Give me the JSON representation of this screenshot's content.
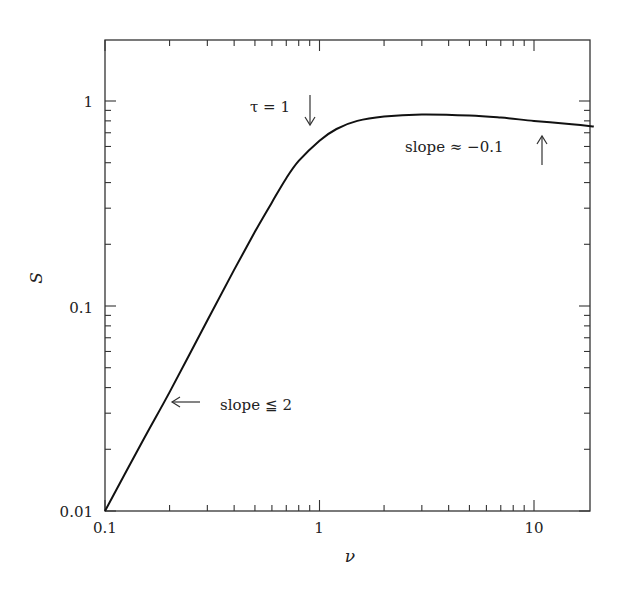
{
  "chart_data": {
    "type": "line",
    "title": "",
    "xlabel": "ν",
    "ylabel": "S",
    "xscale": "log",
    "yscale": "log",
    "xlim": [
      0.1,
      19
    ],
    "ylim": [
      0.01,
      2
    ],
    "grid": false,
    "legend": null,
    "x_tick_labels": [
      "0.1",
      "1",
      "10"
    ],
    "y_tick_labels": [
      "0.01",
      "0.1",
      "1"
    ],
    "series": [
      {
        "name": "S(ν)",
        "x": [
          0.1,
          0.15,
          0.2,
          0.3,
          0.4,
          0.5,
          0.6,
          0.7,
          0.8,
          1.0,
          1.2,
          1.5,
          2.0,
          3.0,
          5.0,
          7.0,
          10.0,
          15.0,
          19.0
        ],
        "y": [
          0.01,
          0.022,
          0.038,
          0.085,
          0.15,
          0.23,
          0.32,
          0.42,
          0.51,
          0.64,
          0.73,
          0.8,
          0.84,
          0.86,
          0.85,
          0.83,
          0.8,
          0.77,
          0.75
        ]
      }
    ],
    "annotations": [
      {
        "text": "τ = 1",
        "arrow": "down",
        "x": 0.95,
        "y": 0.75
      },
      {
        "text": "slope ≈ −0.1",
        "arrow": "up",
        "x": 12,
        "y": 0.7
      },
      {
        "text": "slope ≦ 2",
        "arrow": "left",
        "x": 0.2,
        "y": 0.035
      }
    ]
  },
  "axes": {
    "x_title": "ν",
    "y_title": "S",
    "x_ticks": [
      "0.1",
      "1",
      "10"
    ],
    "y_ticks": [
      "0.01",
      "0.1",
      "1"
    ]
  },
  "annotations": {
    "tau": "τ = 1",
    "slope_high": "slope ≈ −0.1",
    "slope_low": "slope ≦ 2"
  }
}
